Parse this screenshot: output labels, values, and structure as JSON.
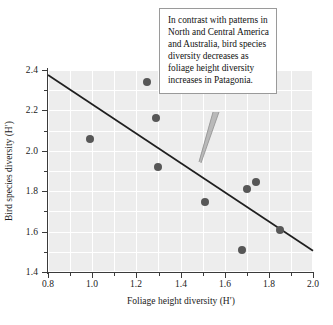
{
  "figure": {
    "background_color": "#ffffff",
    "plot_background_color": "#ededed",
    "gridline_color": "#ffffff",
    "point_color": "#575757",
    "trend_line_color": "#1f1f1f",
    "axis_color": "#3b3b3b"
  },
  "callout": {
    "text": "In contrast with patterns in North and Central America and Australia, bird species diversity decreases as foliage height diversity increases in Patagonia.",
    "border_color": "#9a9a9a",
    "background_color": "#ffffff"
  },
  "axes": {
    "x": {
      "title": "Foliage height diversity (H′)",
      "min": 0.8,
      "max": 2.0,
      "major_ticks": [
        0.8,
        1.0,
        1.2,
        1.4,
        1.6,
        1.8,
        2.0
      ],
      "major_tick_labels": [
        "0.8",
        "1.0",
        "1.2",
        "1.4",
        "1.6",
        "1.8",
        "2.0"
      ],
      "minor_ticks": [
        0.9,
        1.1,
        1.3,
        1.5,
        1.7,
        1.9
      ]
    },
    "y": {
      "title": "Bird species diversity (H′)",
      "min": 1.4,
      "max": 2.4,
      "major_ticks": [
        1.4,
        1.6,
        1.8,
        2.0,
        2.2,
        2.4
      ],
      "major_tick_labels": [
        "1.4",
        "1.6",
        "1.8",
        "2.0",
        "2.2",
        "2.4"
      ],
      "minor_ticks": [
        1.5,
        1.7,
        1.9,
        2.1,
        2.3
      ]
    }
  },
  "chart_data": {
    "type": "scatter",
    "title": "",
    "xlabel": "Foliage height diversity (H′)",
    "ylabel": "Bird species diversity (H′)",
    "xlim": [
      0.8,
      2.0
    ],
    "ylim": [
      1.4,
      2.4
    ],
    "grid": true,
    "legend": "none",
    "x": [
      0.99,
      1.25,
      1.29,
      1.3,
      1.51,
      1.68,
      1.7,
      1.74,
      1.85
    ],
    "y": [
      2.06,
      2.34,
      2.16,
      1.92,
      1.745,
      1.51,
      1.81,
      1.845,
      1.61
    ],
    "points": [
      {
        "x": 0.99,
        "y": 2.06
      },
      {
        "x": 1.25,
        "y": 2.34
      },
      {
        "x": 1.29,
        "y": 2.16
      },
      {
        "x": 1.3,
        "y": 1.92
      },
      {
        "x": 1.51,
        "y": 1.745
      },
      {
        "x": 1.68,
        "y": 1.51
      },
      {
        "x": 1.7,
        "y": 1.81
      },
      {
        "x": 1.74,
        "y": 1.845
      },
      {
        "x": 1.85,
        "y": 1.61
      }
    ],
    "trend_line": {
      "x_start": 0.8,
      "y_start": 2.375,
      "x_end": 2.0,
      "y_end": 1.505,
      "slope": -0.725,
      "intercept": 2.955
    },
    "annotations": [
      {
        "text": "In contrast with patterns in North and Central America and Australia, bird species diversity decreases as foliage height diversity increases in Patagonia.",
        "anchor_x": 1.465,
        "anchor_y": 1.975
      }
    ]
  }
}
